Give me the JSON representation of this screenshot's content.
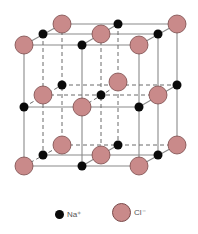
{
  "diagram": {
    "colors": {
      "na_ion": "#0a0a0a",
      "cl_ion": "#c98a8a",
      "cl_stroke": "#7a4a4a",
      "edges": "#8a8a8a"
    }
  },
  "legend": {
    "items": [
      {
        "symbol": "na-ion",
        "label": "Na⁺"
      },
      {
        "symbol": "cl-ion",
        "label": "Cl⁻"
      }
    ]
  }
}
